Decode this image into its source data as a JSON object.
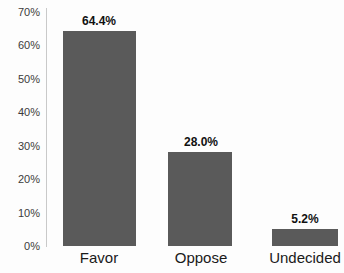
{
  "chart_data": {
    "type": "bar",
    "title": "",
    "subtitle": "",
    "xlabel": "",
    "ylabel": "",
    "categories": [
      "Favor",
      "Oppose",
      "Undecided"
    ],
    "values": [
      64.4,
      28.0,
      5.2
    ],
    "data_labels": [
      "64.4%",
      "28.0%",
      "5.2%"
    ],
    "ylim": [
      0,
      70
    ],
    "ytick_values": [
      70,
      60,
      50,
      40,
      30,
      20,
      10,
      0
    ],
    "ytick_labels": [
      "70%",
      "60%",
      "50%",
      "40%",
      "30%",
      "20%",
      "10%",
      "0%"
    ],
    "grid": false,
    "legend": false,
    "legend_position": "none",
    "bar_color": "#5a5a5a",
    "axis_color": "#c9c9c9",
    "label_color": "#111111",
    "tick_color": "#3b3b3b",
    "background": "#fdfdfd"
  }
}
